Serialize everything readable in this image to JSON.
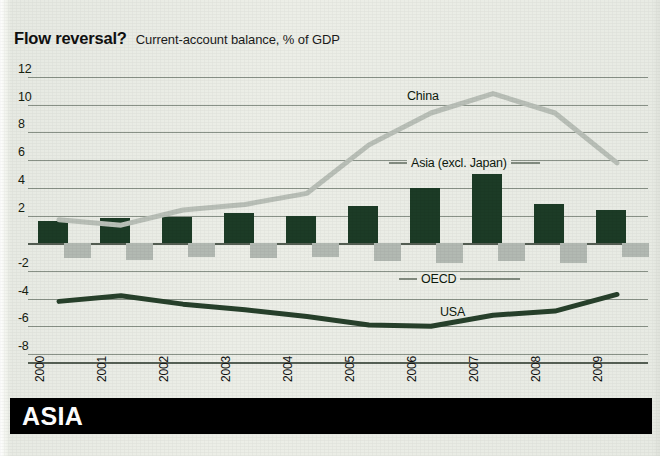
{
  "header": {
    "title": "Flow reversal?",
    "subtitle": "Current-account balance, % of GDP"
  },
  "footer": {
    "banner_label": "ASIA"
  },
  "colors": {
    "asia_bars": "#1c3b26",
    "oecd_bars": "#b2b9b2",
    "china_line": "#b9bfb7",
    "usa_line": "#27402b",
    "background": "#e8ebe4",
    "banner": "#000000"
  },
  "chart_data": {
    "type": "bar",
    "title": "Flow reversal?",
    "subtitle": "Current-account balance, % of GDP",
    "xlabel": "",
    "ylabel": "% of GDP",
    "ylim": [
      -8,
      12
    ],
    "yticks": [
      12,
      10,
      8,
      6,
      4,
      2,
      -2,
      -4,
      -6,
      -8
    ],
    "grid": true,
    "legend_position": "inline-labels",
    "categories": [
      "2000",
      "2001",
      "2002",
      "2003",
      "2004",
      "2005",
      "2006",
      "2007",
      "2008",
      "2009"
    ],
    "series": [
      {
        "name": "Asia (excl. Japan)",
        "type": "bar",
        "color": "#1c3b26",
        "values": [
          1.6,
          1.8,
          1.9,
          2.2,
          2.0,
          2.7,
          4.0,
          5.0,
          2.8,
          2.4
        ]
      },
      {
        "name": "OECD",
        "type": "bar",
        "color": "#b2b9b2",
        "values": [
          -1.1,
          -1.2,
          -1.0,
          -1.1,
          -1.0,
          -1.3,
          -1.4,
          -1.3,
          -1.4,
          -1.0
        ]
      },
      {
        "name": "China",
        "type": "line",
        "color": "#b9bfb7",
        "values": [
          1.7,
          1.3,
          2.4,
          2.8,
          3.6,
          7.1,
          9.4,
          10.8,
          9.4,
          5.8
        ]
      },
      {
        "name": "USA",
        "type": "line",
        "color": "#27402b",
        "values": [
          -4.2,
          -3.8,
          -4.4,
          -4.8,
          -5.3,
          -5.9,
          -6.0,
          -5.2,
          -4.9,
          -3.7
        ]
      }
    ]
  },
  "annotations": {
    "china_label": "China",
    "asia_label": "Asia (excl. Japan)",
    "oecd_label": "OECD",
    "usa_label": "USA"
  }
}
